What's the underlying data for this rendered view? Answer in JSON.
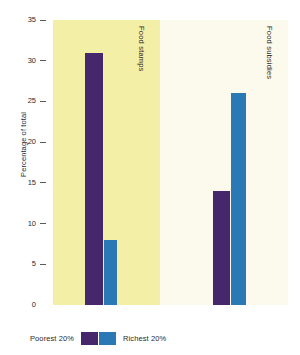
{
  "chart_data": {
    "type": "bar",
    "title": "",
    "xlabel": "",
    "ylabel": "Percentage of total",
    "ylim": [
      0,
      35
    ],
    "yticks": [
      0,
      5,
      10,
      15,
      20,
      25,
      30,
      35
    ],
    "ytick_labels": [
      "0",
      "5",
      "10",
      "15",
      "20",
      "25",
      "30",
      "35"
    ],
    "grid": false,
    "legend_position": "bottom",
    "categories": [
      "Food stamps",
      "Food subsidies"
    ],
    "series": [
      {
        "name": "Poorest 20%",
        "color": "#46276b",
        "values": [
          31,
          14
        ]
      },
      {
        "name": "Richest 20%",
        "color": "#2a79b5",
        "values": [
          8,
          26
        ]
      }
    ],
    "panels": [
      {
        "label": "Food stamps",
        "background": "#f4efa6",
        "bars": [
          {
            "series": "Poorest 20%",
            "value": 31,
            "color": "#46276b"
          },
          {
            "series": "Richest 20%",
            "value": 8,
            "color": "#2a79b5"
          }
        ]
      },
      {
        "label": "Food subsidies",
        "background": "#fbfaec",
        "bars": [
          {
            "series": "Poorest 20%",
            "value": 14,
            "color": "#46276b"
          },
          {
            "series": "Richest 20%",
            "value": 26,
            "color": "#2a79b5"
          }
        ]
      }
    ]
  },
  "legend": {
    "left_label": "Poorest 20%",
    "right_label": "Richest 20%",
    "left_color": "#46276b",
    "right_color": "#2a79b5"
  }
}
